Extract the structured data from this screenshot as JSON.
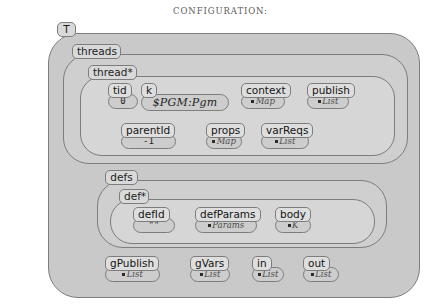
{
  "title": "CONFIGURATION:",
  "root": {
    "label": "T"
  },
  "containers": [
    {
      "name": "threads",
      "label": "threads"
    },
    {
      "name": "thread-star",
      "label": "thread*"
    },
    {
      "name": "defs",
      "label": "defs"
    },
    {
      "name": "def-star",
      "label": "def*"
    }
  ],
  "nodes": {
    "tid": {
      "label": "tid",
      "value": "0",
      "kind": "plain"
    },
    "k": {
      "label": "k",
      "value": "$PGM:Pgm",
      "kind": "big"
    },
    "context": {
      "label": "context",
      "value": "Map",
      "kind": "ref"
    },
    "publish": {
      "label": "publish",
      "value": "List",
      "kind": "ref"
    },
    "parentId": {
      "label": "parentId",
      "value": "-1",
      "kind": "plain"
    },
    "props": {
      "label": "props",
      "value": "Map",
      "kind": "ref"
    },
    "varReqs": {
      "label": "varReqs",
      "value": "List",
      "kind": "ref"
    },
    "defId": {
      "label": "defId",
      "value": "\"\"",
      "kind": "plain"
    },
    "defParams": {
      "label": "defParams",
      "value": "Params",
      "kind": "ref"
    },
    "body": {
      "label": "body",
      "value": "K",
      "kind": "ref"
    },
    "gPublish": {
      "label": "gPublish",
      "value": "List",
      "kind": "ref"
    },
    "gVars": {
      "label": "gVars",
      "value": "List",
      "kind": "ref"
    },
    "in": {
      "label": "in",
      "value": "List",
      "kind": "ref"
    },
    "out": {
      "label": "out",
      "value": "List",
      "kind": "ref"
    }
  },
  "colors": {
    "stroke": "#7d7d7d",
    "level0": "#c9c9c9",
    "level1": "#cfcfcf",
    "level2": "#d6d6d6",
    "level3": "#dcdcdc",
    "tab": "#d9d9d9",
    "value_pill": "#cdcdcd"
  }
}
